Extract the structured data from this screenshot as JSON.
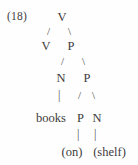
{
  "figure": {
    "example_number": "(18)",
    "type": "syntax-tree",
    "tree": {
      "label": "V",
      "children": [
        {
          "label": "V",
          "children": []
        },
        {
          "label": "P",
          "children": [
            {
              "label": "N",
              "children": [
                {
                  "label": "books",
                  "terminal": true
                }
              ]
            },
            {
              "label": "P",
              "children": [
                {
                  "label": "P",
                  "children": [
                    {
                      "label": "(on)",
                      "terminal": true
                    }
                  ]
                },
                {
                  "label": "N",
                  "children": [
                    {
                      "label": "(shelf)",
                      "terminal": true
                    }
                  ]
                }
              ]
            }
          ]
        }
      ]
    },
    "rows": [
      {
        "id": "row1",
        "cells": [
          "V"
        ]
      },
      {
        "id": "row1b",
        "cells": [
          "/",
          "\\"
        ]
      },
      {
        "id": "row2",
        "cells": [
          "V",
          "P"
        ]
      },
      {
        "id": "row2b",
        "cells": [
          "/",
          "\\"
        ]
      },
      {
        "id": "row3",
        "cells": [
          "N",
          "P"
        ]
      },
      {
        "id": "row3b",
        "cells": [
          "|",
          "/",
          "\\"
        ]
      },
      {
        "id": "row4",
        "cells": [
          "books",
          "P",
          "N"
        ]
      },
      {
        "id": "row4b",
        "cells": [
          "|",
          "|"
        ]
      },
      {
        "id": "row5",
        "cells": [
          "(on)",
          "(shelf)"
        ]
      }
    ],
    "nodes": {
      "root_v": "V",
      "left_v": "V",
      "right_p": "P",
      "n_books": "N",
      "p_inner": "P",
      "word_books": "books",
      "p_leaf": "P",
      "n_leaf": "N",
      "word_on": "(on)",
      "word_shelf": "(shelf)"
    },
    "branches": {
      "slash": "/",
      "backslash": "\\",
      "bar": "|"
    },
    "colors": {
      "background": "#fefefe",
      "text": "#3d3b3b",
      "branch": "#4a4747"
    }
  }
}
